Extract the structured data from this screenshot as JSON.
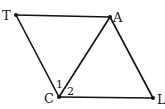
{
  "diagram": {
    "points": {
      "T": {
        "label": "T",
        "x": 16,
        "y": 15
      },
      "A": {
        "label": "A",
        "x": 110,
        "y": 17
      },
      "C": {
        "label": "C",
        "x": 59,
        "y": 97
      },
      "L": {
        "label": "L",
        "x": 153,
        "y": 98
      }
    },
    "segments": [
      {
        "from": "T",
        "to": "A"
      },
      {
        "from": "T",
        "to": "C"
      },
      {
        "from": "C",
        "to": "A"
      },
      {
        "from": "A",
        "to": "L"
      },
      {
        "from": "C",
        "to": "L"
      }
    ],
    "angle_labels": [
      {
        "label": "1",
        "vertex": "C",
        "between": [
          "T",
          "A"
        ]
      },
      {
        "label": "2",
        "vertex": "C",
        "between": [
          "A",
          "L"
        ]
      }
    ],
    "colors": {
      "line": "#111111",
      "background": "#ffffff"
    }
  }
}
